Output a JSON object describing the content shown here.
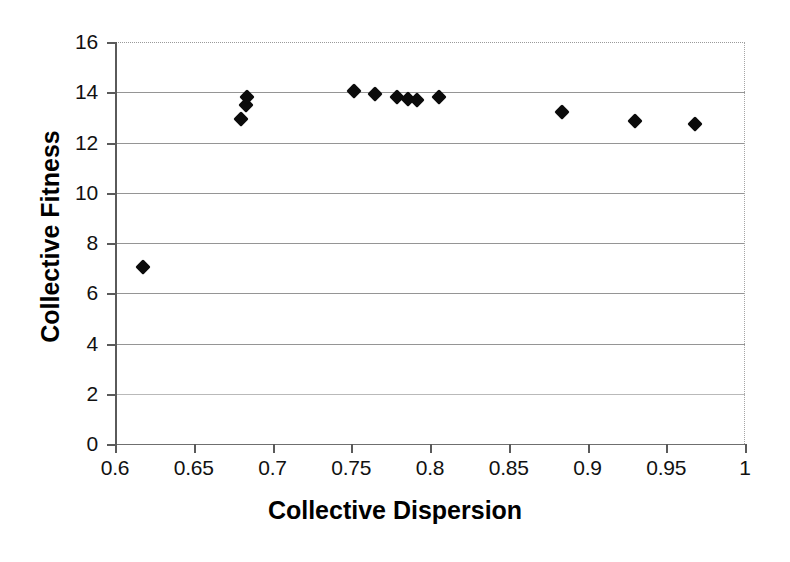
{
  "chart_data": {
    "type": "scatter",
    "title": "",
    "xlabel": "Collective Dispersion",
    "ylabel": "Collective Fitness",
    "xlim": [
      0.6,
      1.0
    ],
    "ylim": [
      0,
      16
    ],
    "grid": true,
    "legend": null,
    "marker": "filled-diamond",
    "marker_color": "#0b0b0b",
    "xticks": [
      "0.6",
      "0.65",
      "0.7",
      "0.75",
      "0.8",
      "0.85",
      "0.9",
      "0.95",
      "1"
    ],
    "xtick_values": [
      0.6,
      0.65,
      0.7,
      0.75,
      0.8,
      0.85,
      0.9,
      0.95,
      1.0
    ],
    "yticks": [
      "0",
      "2",
      "4",
      "6",
      "8",
      "10",
      "12",
      "14",
      "16"
    ],
    "ytick_values": [
      0,
      2,
      4,
      6,
      8,
      10,
      12,
      14,
      16
    ],
    "points": [
      {
        "x": 0.618,
        "y": 7.05
      },
      {
        "x": 0.68,
        "y": 12.95
      },
      {
        "x": 0.683,
        "y": 13.5
      },
      {
        "x": 0.684,
        "y": 13.8
      },
      {
        "x": 0.752,
        "y": 14.05
      },
      {
        "x": 0.765,
        "y": 13.95
      },
      {
        "x": 0.779,
        "y": 13.8
      },
      {
        "x": 0.786,
        "y": 13.75
      },
      {
        "x": 0.792,
        "y": 13.7
      },
      {
        "x": 0.806,
        "y": 13.8
      },
      {
        "x": 0.884,
        "y": 13.2
      },
      {
        "x": 0.93,
        "y": 12.85
      },
      {
        "x": 0.968,
        "y": 12.75
      }
    ]
  }
}
